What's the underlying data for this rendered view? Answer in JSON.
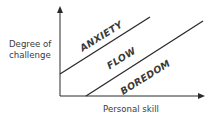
{
  "diagram": {
    "y_axis": {
      "label_line1": "Degree of",
      "label_line2": "challenge"
    },
    "x_axis": {
      "label": "Personal skill"
    },
    "zones": [
      {
        "name": "anxiety",
        "label": "ANXIETY"
      },
      {
        "name": "flow",
        "label": "FLOW"
      },
      {
        "name": "boredom",
        "label": "BOREDOM"
      }
    ],
    "colors": {
      "lines": "#2a2a2a",
      "text": "#3a3a3a",
      "background": "#ffffff"
    }
  }
}
